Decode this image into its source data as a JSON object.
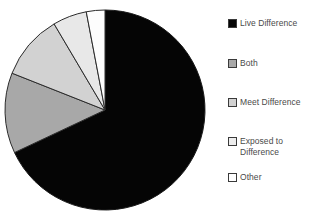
{
  "chart_data": {
    "type": "pie",
    "title": "",
    "subtitle": "",
    "xlabel": "",
    "ylabel": "",
    "grid": false,
    "legend_position": "right",
    "start_angle_deg": 0,
    "direction": "clockwise",
    "center": {
      "x": 105,
      "y": 110
    },
    "radius": 100,
    "categories": [
      "Live Difference",
      "Both",
      "Meet Difference",
      "Exposed to Difference",
      "Other"
    ],
    "values": [
      68,
      13,
      10.5,
      5.5,
      3
    ],
    "value_unit": "percent",
    "slices": [
      {
        "label": "Live Difference",
        "value": 68,
        "start_deg": 0,
        "end_deg": 244.8,
        "color": "#050505",
        "stroke": "#1a1a1a"
      },
      {
        "label": "Both",
        "value": 13,
        "start_deg": 244.8,
        "end_deg": 291.6,
        "color": "#a8a8a8",
        "stroke": "#2b2b2b"
      },
      {
        "label": "Meet Difference",
        "value": 10.5,
        "start_deg": 291.6,
        "end_deg": 329.4,
        "color": "#d2d2d2",
        "stroke": "#2b2b2b"
      },
      {
        "label": "Exposed to Difference",
        "value": 5.5,
        "start_deg": 329.4,
        "end_deg": 349.2,
        "color": "#e8e8e8",
        "stroke": "#2b2b2b"
      },
      {
        "label": "Other",
        "value": 3,
        "start_deg": 349.2,
        "end_deg": 360,
        "color": "#fdfdfd",
        "stroke": "#2b2b2b"
      }
    ]
  },
  "legend": {
    "items": [
      {
        "label": "Live Difference",
        "color": "#050505",
        "border": "#3a3a3a"
      },
      {
        "label": "Both",
        "color": "#a8a8a8",
        "border": "#3a3a3a"
      },
      {
        "label": "Meet Difference",
        "color": "#d2d2d2",
        "border": "#3a3a3a"
      },
      {
        "label": "Exposed to\nDifference",
        "color": "#ededed",
        "border": "#3a3a3a"
      },
      {
        "label": "Other",
        "color": "#ffffff",
        "border": "#3a3a3a"
      }
    ]
  },
  "colors": {
    "background": "#ffffff",
    "text": "#4a4a4a",
    "outline": "#2b2b2b"
  }
}
